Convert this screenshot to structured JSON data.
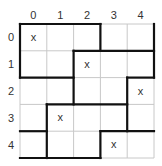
{
  "puzzle": {
    "rows": 5,
    "cols": 5,
    "col_labels": [
      "0",
      "1",
      "2",
      "3",
      "4"
    ],
    "row_labels": [
      "0",
      "1",
      "2",
      "3",
      "4"
    ],
    "marks": [
      {
        "row": 0,
        "col": 0,
        "symbol": "x"
      },
      {
        "row": 1,
        "col": 2,
        "symbol": "x"
      },
      {
        "row": 2,
        "col": 4,
        "symbol": "x"
      },
      {
        "row": 3,
        "col": 1,
        "symbol": "x"
      },
      {
        "row": 4,
        "col": 3,
        "symbol": "x"
      }
    ],
    "thick_segments": [
      {
        "x1": 0,
        "y1": 0,
        "x2": 3,
        "y2": 0
      },
      {
        "x1": 0,
        "y1": 0,
        "x2": 0,
        "y2": 2
      },
      {
        "x1": 3,
        "y1": 0,
        "x2": 3,
        "y2": 1
      },
      {
        "x1": 2,
        "y1": 1,
        "x2": 5,
        "y2": 1
      },
      {
        "x1": 5,
        "y1": 0,
        "x2": 5,
        "y2": 2
      },
      {
        "x1": 2,
        "y1": 1,
        "x2": 2,
        "y2": 3
      },
      {
        "x1": 0,
        "y1": 2,
        "x2": 2,
        "y2": 2
      },
      {
        "x1": 4,
        "y1": 2,
        "x2": 5,
        "y2": 2
      },
      {
        "x1": 4,
        "y1": 2,
        "x2": 4,
        "y2": 4
      },
      {
        "x1": 1,
        "y1": 3,
        "x2": 4,
        "y2": 3
      },
      {
        "x1": 1,
        "y1": 3,
        "x2": 1,
        "y2": 5
      },
      {
        "x1": 0,
        "y1": 4,
        "x2": 1,
        "y2": 4
      },
      {
        "x1": 3,
        "y1": 4,
        "x2": 5,
        "y2": 4
      },
      {
        "x1": 3,
        "y1": 4,
        "x2": 3,
        "y2": 5
      },
      {
        "x1": 0,
        "y1": 5,
        "x2": 3,
        "y2": 5
      }
    ],
    "colors": {
      "thin_line": "#c8c8c8",
      "thick_line": "#111111",
      "text": "#333333"
    }
  }
}
